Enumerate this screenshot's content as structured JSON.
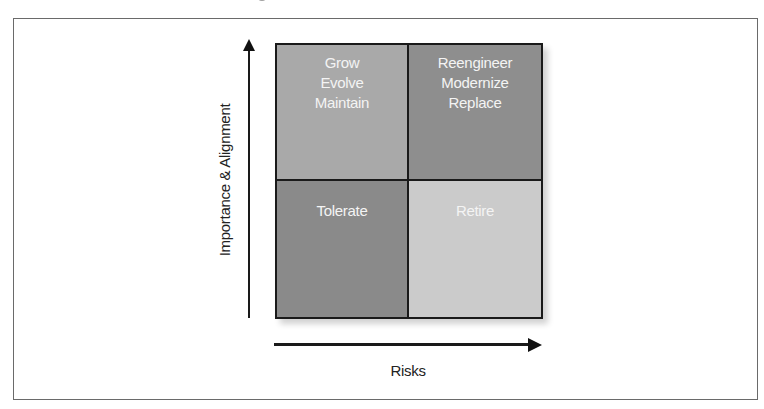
{
  "diagram": {
    "type": "2x2 matrix",
    "y_axis": {
      "label": "Importance & Alignment",
      "direction": "up"
    },
    "x_axis": {
      "label": "Risks",
      "direction": "right"
    },
    "quadrants": {
      "top_left": {
        "lines": [
          "Grow",
          "Evolve",
          "Maintain"
        ],
        "fill": "#a9a9a9"
      },
      "top_right": {
        "lines": [
          "Reengineer",
          "Modernize",
          "Replace"
        ],
        "fill": "#8e8e8e"
      },
      "bottom_left": {
        "lines": [
          "Tolerate"
        ],
        "fill": "#8a8a8a"
      },
      "bottom_right": {
        "lines": [
          "Retire"
        ],
        "fill": "#cbcbcb"
      }
    },
    "colors": {
      "grid_border": "#1a1a1a",
      "frame_border": "#6a6a6a",
      "quadrant_text": "#f4f4f4",
      "axis": "#1a1a1a"
    }
  }
}
